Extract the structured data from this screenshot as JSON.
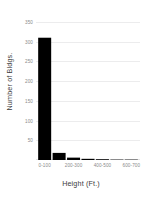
{
  "chart_data": {
    "type": "bar",
    "title": "",
    "xlabel": "Height (Ft.)",
    "ylabel": "Number of Bldgs.",
    "categories": [
      "0-100",
      "100-200",
      "200-300",
      "300-400",
      "400-500",
      "500-600",
      "600-700"
    ],
    "values": [
      310,
      18,
      6,
      3,
      2,
      1,
      1
    ],
    "xtick_labels": [
      "0-100",
      "200-300",
      "400-500",
      "600-700"
    ],
    "xtick_positions": [
      0,
      2,
      4,
      6
    ],
    "ytick_labels": [
      "50",
      "100",
      "150",
      "200",
      "250",
      "300",
      "350"
    ],
    "ytick_values": [
      50,
      100,
      150,
      200,
      250,
      300,
      350
    ],
    "ylim": [
      0,
      360
    ],
    "xlim": [
      -0.6,
      6.6
    ],
    "grid": "horizontal",
    "legend": "none",
    "bar_color": "#000000",
    "grid_color": "#ececed",
    "tick_label_color": "#8a8a8a",
    "axis_label_color": "#3a3a3a",
    "background_color": "#ffffff"
  }
}
